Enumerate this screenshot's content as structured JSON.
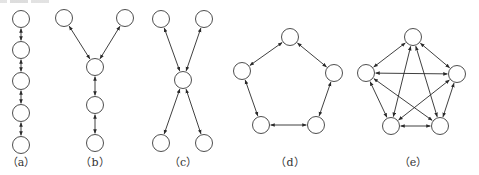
{
  "figure": {
    "node_radius": 8.5,
    "colors": {
      "stroke": "#3a3a3a",
      "edge": "#2a2a2a",
      "label": "#333333",
      "background": "#ffffff"
    },
    "panels": [
      {
        "id": "a",
        "label": "（a）",
        "label_pos": [
          21,
          166
        ],
        "topology": "chain",
        "nodes": [
          [
            21,
            19
          ],
          [
            21,
            50
          ],
          [
            21,
            81
          ],
          [
            21,
            113
          ],
          [
            21,
            145
          ]
        ],
        "edges": [
          [
            0,
            1
          ],
          [
            1,
            2
          ],
          [
            2,
            3
          ],
          [
            3,
            4
          ]
        ]
      },
      {
        "id": "b",
        "label": "（b）",
        "label_pos": [
          95,
          166
        ],
        "topology": "tree",
        "nodes": [
          [
            64,
            18
          ],
          [
            125,
            18
          ],
          [
            95,
            67
          ],
          [
            95,
            105
          ],
          [
            95,
            143
          ]
        ],
        "edges": [
          [
            0,
            2
          ],
          [
            1,
            2
          ],
          [
            2,
            3
          ],
          [
            3,
            4
          ]
        ]
      },
      {
        "id": "c",
        "label": "（c）",
        "label_pos": [
          183,
          166
        ],
        "topology": "star",
        "nodes": [
          [
            161,
            19
          ],
          [
            204,
            19
          ],
          [
            183,
            80
          ],
          [
            161,
            143
          ],
          [
            204,
            143
          ]
        ],
        "edges": [
          [
            0,
            2
          ],
          [
            1,
            2
          ],
          [
            2,
            3
          ],
          [
            2,
            4
          ]
        ]
      },
      {
        "id": "d",
        "label": "（d）",
        "label_pos": [
          290,
          166
        ],
        "topology": "ring",
        "nodes": [
          [
            290,
            37
          ],
          [
            242,
            71
          ],
          [
            334,
            73
          ],
          [
            261,
            125
          ],
          [
            316,
            125
          ]
        ],
        "edges": [
          [
            0,
            1
          ],
          [
            0,
            2
          ],
          [
            1,
            3
          ],
          [
            2,
            4
          ],
          [
            3,
            4
          ]
        ]
      },
      {
        "id": "e",
        "label": "（e）",
        "label_pos": [
          413,
          166
        ],
        "topology": "fully-connected",
        "nodes": [
          [
            413,
            37
          ],
          [
            366,
            73
          ],
          [
            457,
            74
          ],
          [
            391,
            126
          ],
          [
            440,
            126
          ]
        ],
        "edges": [
          [
            0,
            1
          ],
          [
            0,
            2
          ],
          [
            0,
            3
          ],
          [
            0,
            4
          ],
          [
            1,
            2
          ],
          [
            1,
            3
          ],
          [
            1,
            4
          ],
          [
            2,
            3
          ],
          [
            2,
            4
          ],
          [
            3,
            4
          ]
        ]
      }
    ]
  }
}
